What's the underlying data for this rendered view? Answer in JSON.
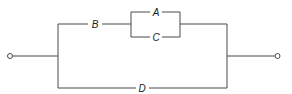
{
  "diagram": {
    "type": "series-parallel network",
    "components": [
      {
        "id": "A",
        "label": "A"
      },
      {
        "id": "B",
        "label": "B"
      },
      {
        "id": "C",
        "label": "C"
      },
      {
        "id": "D",
        "label": "D"
      }
    ],
    "structure": "input -> ( (B series (A parallel C)) parallel D ) -> output",
    "colors": {
      "line": "#4a4a4a",
      "text": "#222222",
      "background": "#ffffff"
    }
  },
  "labels": {
    "a": "A",
    "b": "B",
    "c": "C",
    "d": "D"
  }
}
